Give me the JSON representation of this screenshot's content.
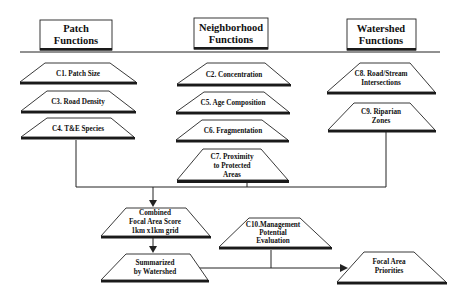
{
  "headers": [
    {
      "id": "patch",
      "lines": [
        "Patch",
        "Functions"
      ]
    },
    {
      "id": "neighborhood",
      "lines": [
        "Neighborhood",
        "Functions"
      ]
    },
    {
      "id": "watershed",
      "lines": [
        "Watershed",
        "Functions"
      ]
    }
  ],
  "criteria": {
    "c1": [
      "C1. Patch Size"
    ],
    "c3": [
      "C3.  Road Density"
    ],
    "c4": [
      "C4. T&E Species"
    ],
    "c2": [
      "C2. Concentration"
    ],
    "c5": [
      "C5. Age Composition"
    ],
    "c6": [
      "C6. Fragmentation"
    ],
    "c7": [
      "C7. Proximity",
      "to Protected",
      "Areas"
    ],
    "c8": [
      "C8.  Road/Stream",
      "Intersections"
    ],
    "c9": [
      "C9.  Riparian",
      "Zones"
    ],
    "c10": [
      "C10.Management",
      "Potential",
      "Evaluation"
    ]
  },
  "outputs": {
    "combined": [
      "Combined",
      "Focal Area Score",
      "1km x1km grid"
    ],
    "summarized": [
      "Summarized",
      "by Watershed"
    ],
    "priorities": [
      "Focal Area",
      "Priorities"
    ]
  },
  "colors": {
    "ink": "#222222",
    "base": "#1a1a1a",
    "background": "#ffffff"
  }
}
